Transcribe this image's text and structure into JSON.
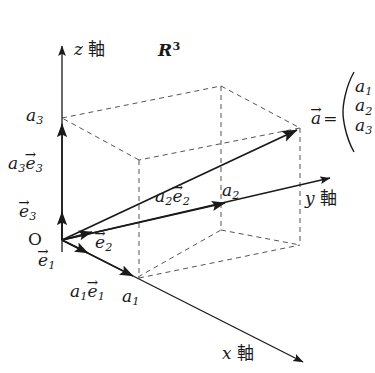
{
  "figure": {
    "space_label": "R",
    "space_exponent": "3",
    "origin_label": "O",
    "axes": {
      "z": {
        "var": "z",
        "word": "軸"
      },
      "y": {
        "var": "y",
        "word": "軸"
      },
      "x": {
        "var": "x",
        "word": "軸"
      }
    },
    "basis": {
      "e1": {
        "base": "e",
        "sub": "1",
        "arrow": "→"
      },
      "e2": {
        "base": "e",
        "sub": "2",
        "arrow": "→"
      },
      "e3": {
        "base": "e",
        "sub": "3",
        "arrow": "→"
      }
    },
    "components": {
      "a1": {
        "base": "a",
        "sub": "1"
      },
      "a2": {
        "base": "a",
        "sub": "2"
      },
      "a3": {
        "base": "a",
        "sub": "3"
      }
    },
    "scaled_basis": {
      "a1e1": {
        "coef": "a",
        "coef_sub": "1",
        "base": "e",
        "sub": "1",
        "arrow": "→"
      },
      "a2e2": {
        "coef": "a",
        "coef_sub": "2",
        "base": "e",
        "sub": "2",
        "arrow": "→"
      },
      "a3e3": {
        "coef": "a",
        "coef_sub": "3",
        "base": "e",
        "sub": "3",
        "arrow": "→"
      }
    },
    "vector_a": {
      "base": "a",
      "arrow": "→",
      "equals": "="
    },
    "column_vector": {
      "entries": [
        "a",
        "a",
        "a"
      ],
      "subs": [
        "1",
        "2",
        "3"
      ],
      "open_paren": "︷"
    },
    "colors": {
      "stroke": "#1a1a1a",
      "dashed": "#555555",
      "background": "#ffffff"
    }
  }
}
